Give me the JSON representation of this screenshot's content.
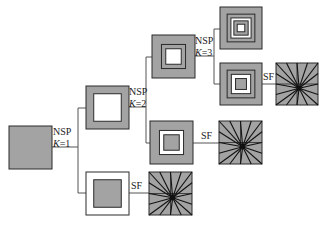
{
  "diagram": {
    "colors": {
      "gray": "#a3a3a3",
      "white": "#ffffff",
      "stroke": "#2a2a2a",
      "line": "#555555",
      "center": "#111111"
    },
    "nodes": [
      {
        "id": "root",
        "type": "nested-square",
        "rings": [
          "gray"
        ]
      },
      {
        "id": "k1-upper",
        "type": "nested-square",
        "rings": [
          "gray",
          "white"
        ]
      },
      {
        "id": "k1-lower",
        "type": "nested-square",
        "rings": [
          "white",
          "gray"
        ]
      },
      {
        "id": "k2-upper",
        "type": "nested-square",
        "rings": [
          "gray",
          "gray",
          "white"
        ]
      },
      {
        "id": "k2-lower",
        "type": "nested-square",
        "rings": [
          "gray",
          "white",
          "gray"
        ]
      },
      {
        "id": "k3-upper",
        "type": "nested-square",
        "rings": [
          "gray",
          "gray",
          "white",
          "gray",
          "white"
        ]
      },
      {
        "id": "k3-lower",
        "type": "nested-square",
        "rings": [
          "gray",
          "gray",
          "white",
          "gray"
        ]
      },
      {
        "id": "sf-k1",
        "type": "star-fan",
        "spokes": 16
      },
      {
        "id": "sf-k2",
        "type": "star-fan",
        "spokes": 16
      },
      {
        "id": "sf-k3",
        "type": "star-fan",
        "spokes": 16
      }
    ],
    "edges": [
      {
        "id": "edge-nsp-k1",
        "label": "NSP",
        "sublabel_var": "K",
        "sublabel_val": "=1"
      },
      {
        "id": "edge-nsp-k2",
        "label": "NSP",
        "sublabel_var": "K",
        "sublabel_val": "=2"
      },
      {
        "id": "edge-nsp-k3",
        "label": "NSP",
        "sublabel_var": "K",
        "sublabel_val": "=3"
      },
      {
        "id": "edge-sf-k1",
        "label": "SF"
      },
      {
        "id": "edge-sf-k2",
        "label": "SF"
      },
      {
        "id": "edge-sf-k3",
        "label": "SF"
      }
    ]
  }
}
